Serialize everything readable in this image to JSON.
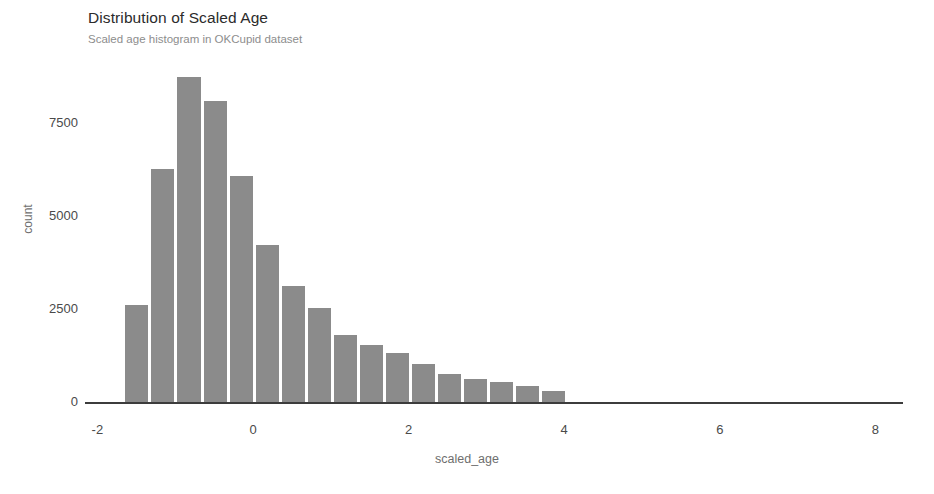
{
  "chart_data": {
    "type": "bar",
    "title": "Distribution of Scaled Age",
    "subtitle": "Scaled age histogram in OKCupid dataset",
    "xlabel": "scaled_age",
    "ylabel": "count",
    "xlim": [
      -2.17,
      8.4
    ],
    "ylim": [
      0,
      9200
    ],
    "xticks": [
      -2,
      0,
      2,
      4,
      6,
      8
    ],
    "xtick_labels": [
      "-2",
      "0",
      "2",
      "4",
      "6",
      "8"
    ],
    "yticks": [
      0,
      2500,
      5000,
      7500
    ],
    "ytick_labels": [
      "0",
      "2500",
      "5000",
      "7500"
    ],
    "grid": false,
    "legend": false,
    "bar_color": "#8b8b8b",
    "axis_color": "#3c3c3c",
    "bin_width": 0.335,
    "bin_starts": [
      -1.66,
      -1.325,
      -0.99,
      -0.655,
      -0.32,
      0.015,
      0.35,
      0.685,
      1.02,
      1.355,
      1.69,
      2.025,
      2.36,
      2.695,
      3.03,
      3.365
    ],
    "bin_centers": [
      -1.49,
      -1.16,
      -0.82,
      -0.49,
      -0.15,
      0.18,
      0.52,
      0.85,
      1.19,
      1.52,
      1.86,
      2.19,
      2.53,
      2.86,
      3.2,
      3.53
    ],
    "values": [
      2610,
      6270,
      8730,
      8090,
      6070,
      4220,
      3130,
      2540,
      1790,
      1530,
      1330,
      1010,
      740,
      620,
      530,
      420,
      300
    ],
    "categories": [
      "-1.66",
      "-1.33",
      "-0.99",
      "-0.66",
      "-0.32",
      "0.02",
      "0.35",
      "0.69",
      "1.02",
      "1.36",
      "1.69",
      "2.03",
      "2.36",
      "2.70",
      "3.03",
      "3.37",
      "3.70"
    ]
  },
  "chart": {
    "title": "Distribution of Scaled Age",
    "subtitle": "Scaled age histogram in OKCupid dataset",
    "x_axis_title": "scaled_age",
    "y_axis_title": "count"
  }
}
